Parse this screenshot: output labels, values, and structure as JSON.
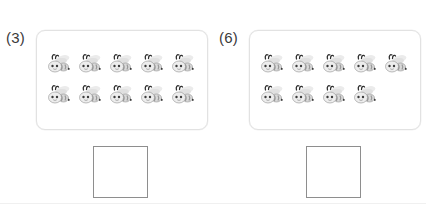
{
  "worksheet": {
    "type": "counting-exercise",
    "background_color": "#ffffff",
    "panel_border_color": "#e2e2e2",
    "answer_box_border_color": "#8e8e8e",
    "label_color": "#3a3a3a",
    "bee_body_color": "#d9d9d9",
    "bee_stripe_color": "#9a9a9a",
    "bee_wing_color": "#ebebeb",
    "bee_outline_color": "#8a8a8a",
    "bee_antenna_color": "#2e2e2e",
    "problems": [
      {
        "number_label": "(3)",
        "icon_name": "bee-icon",
        "rows": [
          5,
          5
        ],
        "total_count": 10,
        "answer_value": "",
        "answer_placeholder": ""
      },
      {
        "number_label": "(6)",
        "icon_name": "bee-icon",
        "rows": [
          5,
          4
        ],
        "total_count": 9,
        "answer_value": "",
        "answer_placeholder": ""
      }
    ]
  }
}
